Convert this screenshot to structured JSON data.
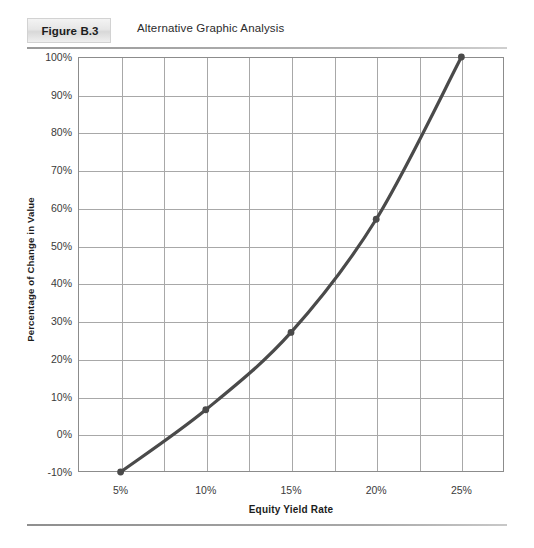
{
  "figure": {
    "number_label": "Figure B.3",
    "title": "Alternative Graphic Analysis"
  },
  "chart_data": {
    "type": "line",
    "title": "Alternative Graphic Analysis",
    "xlabel": "Equity Yield Rate",
    "ylabel": "Percentage of Change in Value",
    "x": [
      5,
      10,
      15,
      20,
      25
    ],
    "values": [
      -10,
      6.5,
      27,
      57,
      100
    ],
    "x_tick_labels": [
      "5%",
      "10%",
      "15%",
      "20%",
      "25%"
    ],
    "y_tick_labels": [
      "100%",
      "90%",
      "80%",
      "70%",
      "60%",
      "50%",
      "40%",
      "30%",
      "20%",
      "10%",
      "0%",
      "-10%"
    ],
    "y_ticks": [
      100,
      90,
      80,
      70,
      60,
      50,
      40,
      30,
      20,
      10,
      0,
      -10
    ],
    "xlim": [
      2.5,
      27.5
    ],
    "ylim": [
      -10,
      100
    ],
    "grid": true,
    "legend": "none",
    "series_color": "#4a4a4a",
    "marker": "circle",
    "gridline_color": "#a8a8a8",
    "x_minor_gridlines": [
      5,
      7.5,
      10,
      12.5,
      15,
      17.5,
      20,
      22.5,
      25
    ],
    "point_labels": [
      {
        "x": "5%",
        "y": "-10%"
      },
      {
        "x": "10%",
        "y": "6.5%"
      },
      {
        "x": "15%",
        "y": "27%"
      },
      {
        "x": "20%",
        "y": "57%"
      },
      {
        "x": "25%",
        "y": "100%"
      }
    ]
  },
  "colors": {
    "curve": "#4a4a4a",
    "grid": "#a8a8a8",
    "frame": "#8c8c8c",
    "rule": "#9a9a9a"
  }
}
